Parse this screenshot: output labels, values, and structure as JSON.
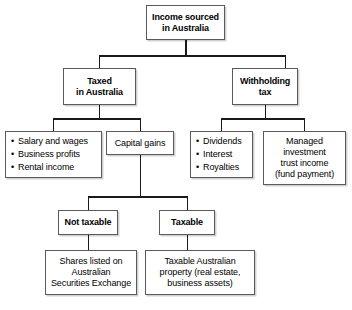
{
  "diagram": {
    "type": "flowchart",
    "orientation": "top-down",
    "colors": {
      "box_fill": "#ffffff",
      "box_border": "#5a5a5a",
      "connector": "#1a1a1a",
      "text": "#000000"
    },
    "nodes": {
      "root": {
        "id": "income-sourced",
        "label": "Income sourced\nin Australia",
        "line1": "Income sourced",
        "line2": "in Australia",
        "emphasis": "bold",
        "level": 1
      },
      "taxed_in_australia": {
        "id": "taxed-in-australia",
        "line1": "Taxed",
        "line2": "in Australia",
        "emphasis": "bold",
        "level": 2
      },
      "withholding_tax": {
        "id": "withholding-tax",
        "line1": "Withholding",
        "line2": "tax",
        "emphasis": "bold",
        "level": 2
      },
      "ordinary_income": {
        "id": "ordinary-income-list",
        "emphasis": "normal",
        "level": 3,
        "items": [
          "Salary and wages",
          "Business profits",
          "Rental income"
        ]
      },
      "capital_gains": {
        "id": "capital-gains",
        "line1": "Capital gains",
        "emphasis": "normal",
        "level": 3
      },
      "withholding_items": {
        "id": "withholding-income-list",
        "emphasis": "normal",
        "level": 3,
        "items": [
          "Dividends",
          "Interest",
          "Royalties"
        ]
      },
      "managed_investment_trust": {
        "id": "managed-investment-trust",
        "emphasis": "normal",
        "level": 3,
        "lines": [
          "Managed",
          "investment",
          "trust income",
          "(fund payment)"
        ]
      },
      "not_taxable": {
        "id": "not-taxable",
        "line1": "Not taxable",
        "emphasis": "bold",
        "level": 4
      },
      "taxable": {
        "id": "taxable",
        "line1": "Taxable",
        "emphasis": "bold",
        "level": 4
      },
      "shares_listed": {
        "id": "shares-listed-asx",
        "emphasis": "normal",
        "level": 5,
        "lines": [
          "Shares listed on",
          "Australian",
          "Securities Exchange"
        ]
      },
      "taxable_australian_property": {
        "id": "taxable-australian-property",
        "emphasis": "normal",
        "level": 5,
        "lines": [
          "Taxable Australian",
          "property (real estate,",
          "business assets)"
        ]
      }
    },
    "edges": [
      {
        "from": "income-sourced",
        "to": "taxed-in-australia"
      },
      {
        "from": "income-sourced",
        "to": "withholding-tax"
      },
      {
        "from": "taxed-in-australia",
        "to": "ordinary-income-list"
      },
      {
        "from": "taxed-in-australia",
        "to": "capital-gains"
      },
      {
        "from": "withholding-tax",
        "to": "withholding-income-list"
      },
      {
        "from": "withholding-tax",
        "to": "managed-investment-trust"
      },
      {
        "from": "capital-gains",
        "to": "not-taxable"
      },
      {
        "from": "capital-gains",
        "to": "taxable"
      },
      {
        "from": "not-taxable",
        "to": "shares-listed-asx"
      },
      {
        "from": "taxable",
        "to": "taxable-australian-property"
      }
    ]
  }
}
